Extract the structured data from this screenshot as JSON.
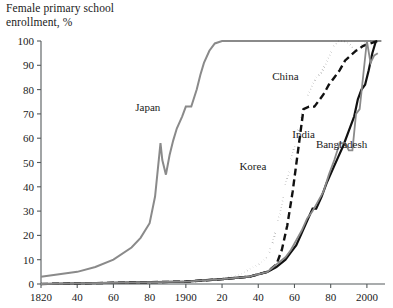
{
  "chart_data": {
    "type": "line",
    "title": "Female primary school\nenrollment, %",
    "xlabel": "",
    "ylabel": "",
    "xlim": [
      1820,
      2010
    ],
    "ylim": [
      0,
      100
    ],
    "grid": false,
    "legend": "inline-annotations",
    "y_ticks": [
      0,
      10,
      20,
      30,
      40,
      50,
      60,
      70,
      80,
      90,
      100
    ],
    "y_tick_labels": [
      "0",
      "10",
      "20",
      "30",
      "40",
      "50",
      "60",
      "70",
      "80",
      "90",
      "100"
    ],
    "x_ticks": [
      1820,
      1840,
      1860,
      1880,
      1900,
      1920,
      1940,
      1960,
      1980,
      2000
    ],
    "x_tick_labels": [
      "1820",
      "40",
      "60",
      "80",
      "1900",
      "20",
      "40",
      "60",
      "80",
      "2000"
    ],
    "series": [
      {
        "name": "Japan",
        "style": "solid",
        "color": "#8a8a8a",
        "width": 2.0,
        "label_x": 1879,
        "label_y": 71,
        "x": [
          1820,
          1830,
          1840,
          1850,
          1860,
          1870,
          1875,
          1880,
          1883,
          1886,
          1887,
          1889,
          1891,
          1893,
          1895,
          1898,
          1900,
          1903,
          1906,
          1908,
          1910,
          1913,
          1916,
          1920,
          1930,
          1940,
          1950,
          1960,
          1970,
          1980,
          1990,
          2000,
          2008
        ],
        "y": [
          3,
          4,
          5,
          7,
          10,
          15,
          19,
          25,
          36,
          58,
          51,
          45,
          53,
          59,
          64,
          69,
          73,
          73,
          80,
          86,
          91,
          96,
          99,
          100,
          100,
          100,
          100,
          100,
          100,
          100,
          100,
          100,
          100
        ]
      },
      {
        "name": "Korea",
        "style": "dotted",
        "color": "#111111",
        "width": 2.0,
        "label_x": 1937,
        "label_y": 47,
        "x": [
          1820,
          1900,
          1920,
          1930,
          1935,
          1940,
          1945,
          1948,
          1951,
          1954,
          1957,
          1960,
          1963,
          1966,
          1969,
          1972,
          1975,
          1978,
          1981,
          1984,
          1987,
          1990,
          1994,
          1998,
          2002,
          2006
        ],
        "y": [
          0,
          1,
          2,
          4,
          6,
          8,
          11,
          17,
          26,
          37,
          47,
          57,
          66,
          75,
          80,
          85,
          87,
          92,
          97,
          100,
          100,
          99,
          96,
          99,
          100,
          100
        ]
      },
      {
        "name": "China",
        "style": "dashed",
        "color": "#111111",
        "width": 2.4,
        "label_x": 1955,
        "label_y": 84,
        "x": [
          1820,
          1900,
          1920,
          1935,
          1945,
          1950,
          1953,
          1956,
          1959,
          1962,
          1965,
          1968,
          1971,
          1973,
          1976,
          1979,
          1982,
          1985,
          1988,
          1991,
          1994,
          1998,
          2002,
          2006
        ],
        "y": [
          0,
          1,
          2,
          3,
          5,
          8,
          14,
          24,
          38,
          55,
          72,
          73,
          73,
          75,
          78,
          82,
          85,
          88,
          92,
          94,
          96,
          98,
          99,
          100
        ]
      },
      {
        "name": "India",
        "style": "solid",
        "color": "#111111",
        "width": 2.2,
        "label_x": 1965,
        "label_y": 60,
        "x": [
          1820,
          1900,
          1920,
          1935,
          1945,
          1950,
          1955,
          1958,
          1961,
          1964,
          1967,
          1970,
          1972,
          1975,
          1978,
          1981,
          1984,
          1987,
          1990,
          1993,
          1995,
          1997,
          1999,
          2001,
          2003,
          2005
        ],
        "y": [
          0,
          1,
          2,
          3,
          5,
          7,
          10,
          13,
          16,
          21,
          26,
          31,
          31,
          36,
          42,
          47,
          52,
          57,
          63,
          69,
          76,
          80,
          82,
          88,
          95,
          100
        ]
      },
      {
        "name": "Bangladesh",
        "style": "solid",
        "color": "#8a8a8a",
        "width": 1.8,
        "label_x": 1986,
        "label_y": 56,
        "x": [
          1820,
          1900,
          1920,
          1935,
          1945,
          1950,
          1955,
          1958,
          1961,
          1964,
          1967,
          1970,
          1973,
          1976,
          1979,
          1982,
          1985,
          1988,
          1990,
          1992,
          1994,
          1996,
          1998,
          2000,
          2002,
          2004,
          2006
        ],
        "y": [
          0,
          1,
          2,
          3,
          5,
          8,
          11,
          14,
          18,
          22,
          27,
          30,
          34,
          38,
          45,
          51,
          58,
          58,
          55,
          55,
          70,
          72,
          86,
          100,
          91,
          94,
          95
        ]
      }
    ]
  }
}
